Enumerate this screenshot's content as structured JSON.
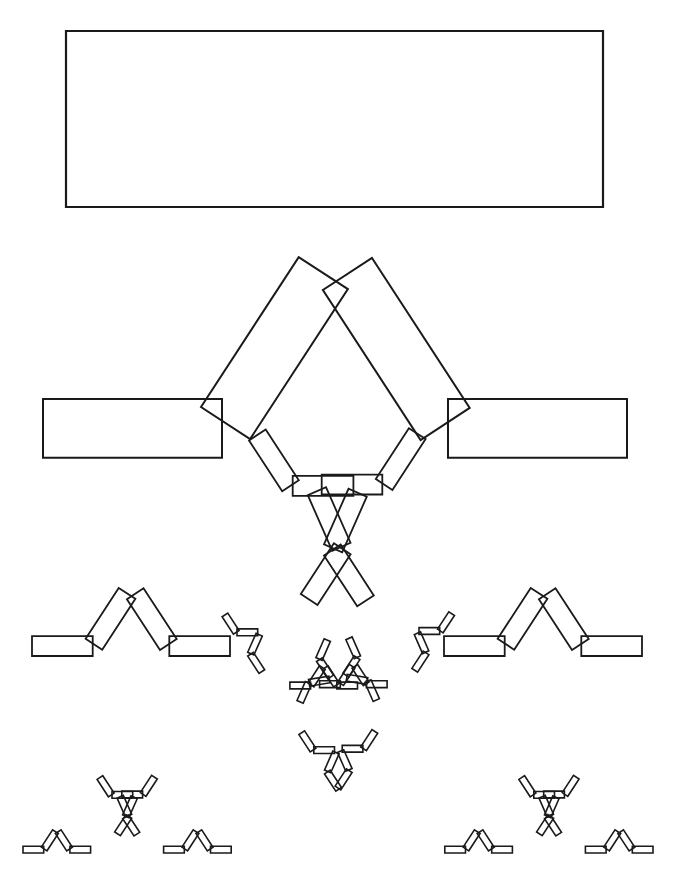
{
  "figure": {
    "stroke_color": "#1a1a1a",
    "background": "#ffffff",
    "base_rectangle": {
      "x": 66,
      "y": 31,
      "width": 537,
      "height": 176,
      "stroke_width": 2.2
    },
    "maps": [
      {
        "name": "left-flat",
        "tx": 43,
        "ty": 399,
        "angle_deg": 0,
        "scale": 0.3333
      },
      {
        "name": "left-tilted",
        "tx": 201,
        "ty": 407,
        "angle_deg": -56.9,
        "scale": 0.3333
      },
      {
        "name": "right-tilted",
        "tx": 372,
        "ty": 258,
        "angle_deg": 56.9,
        "scale": 0.3333
      },
      {
        "name": "right-flat",
        "tx": 448,
        "ty": 399,
        "angle_deg": 0,
        "scale": 0.3333
      }
    ],
    "levels": [
      {
        "level": 0,
        "label": "Stage 0: initial rectangle",
        "stroke_width": 2.2,
        "fit": null
      },
      {
        "level": 1,
        "label": "Stage 1: four scaled copies",
        "stroke_width": 2.0,
        "fit": null
      },
      {
        "level": 2,
        "label": "Stage 2: sixteen copies",
        "stroke_width": 1.8,
        "fit": {
          "x0": 32,
          "x1": 642,
          "bottom": 656
        }
      },
      {
        "level": 3,
        "label": "Stage 3: sixty-four copies",
        "stroke_width": 1.6,
        "fit": {
          "x0": 23,
          "x1": 653,
          "bottom": 853
        }
      }
    ]
  },
  "caption": {
    "text": "",
    "cropped": true
  }
}
